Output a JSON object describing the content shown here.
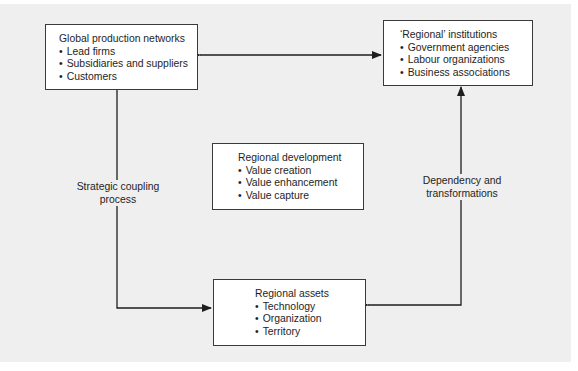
{
  "diagram": {
    "nodes": {
      "global_production_networks": {
        "title": "Global production networks",
        "items": [
          "Lead firms",
          "Subsidiaries and suppliers",
          "Customers"
        ]
      },
      "regional_institutions": {
        "title": "‘Regional’ institutions",
        "items": [
          "Government agencies",
          "Labour organizations",
          "Business associations"
        ]
      },
      "regional_development": {
        "title": "Regional development",
        "items": [
          "Value creation",
          "Value enhancement",
          "Value capture"
        ]
      },
      "regional_assets": {
        "title": "Regional assets",
        "items": [
          "Technology",
          "Organization",
          "Territory"
        ]
      }
    },
    "edges": [
      {
        "from": "global_production_networks",
        "to": "regional_institutions",
        "type": "bidirectional",
        "label": ""
      },
      {
        "from": "regional_assets",
        "to": "global_production_networks",
        "type": "bidirectional",
        "label": "Strategic coupling process"
      },
      {
        "from": "regional_assets",
        "to": "regional_institutions",
        "type": "bidirectional",
        "label": "Dependency and transformations"
      }
    ],
    "labels": {
      "coupling_line1": "Strategic coupling",
      "coupling_line2": "process",
      "dependency_line1": "Dependency and",
      "dependency_line2": "transformations"
    }
  }
}
